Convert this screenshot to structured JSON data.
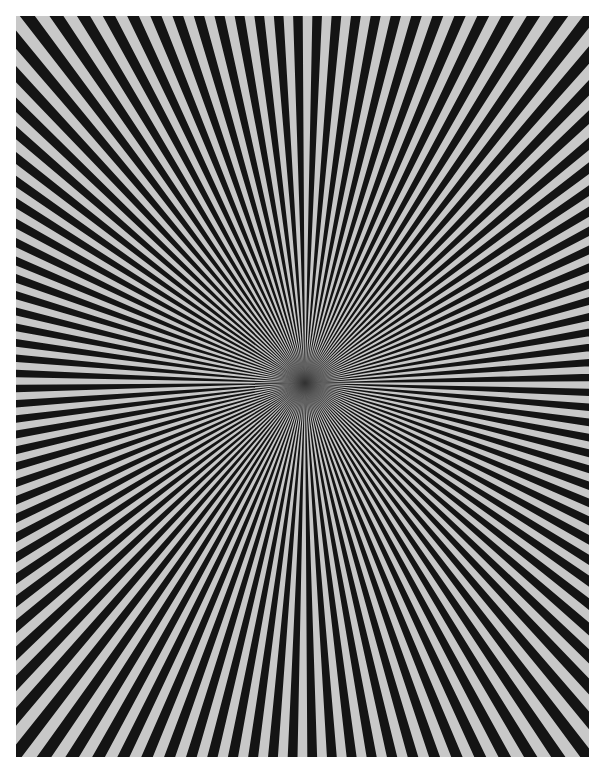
{
  "image": {
    "subject": "Siemens star test pattern",
    "description": "Radial black and light-grey alternating wedges converging to a central point",
    "colors": {
      "background": "#ffffff",
      "dark_wedge": "#141414",
      "light_wedge": "#c8c8c8",
      "center": "#303030"
    },
    "pattern": {
      "wedge_pairs": 120,
      "center_x": 289,
      "center_y": 367,
      "width": 573,
      "height": 741
    }
  }
}
